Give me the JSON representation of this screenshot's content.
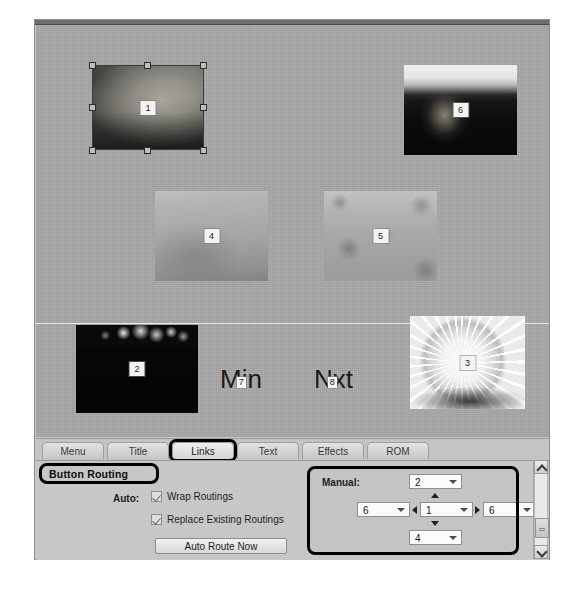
{
  "window": {
    "title": "Button Routing editor"
  },
  "canvas": {
    "guide_line_label": "horizontal-guide",
    "thumbnails": [
      {
        "badge": "1",
        "name": "thumbnail-1",
        "selected": true
      },
      {
        "badge": "6",
        "name": "thumbnail-6",
        "selected": false
      },
      {
        "badge": "4",
        "name": "thumbnail-4",
        "selected": false
      },
      {
        "badge": "5",
        "name": "thumbnail-5",
        "selected": false
      },
      {
        "badge": "2",
        "name": "thumbnail-2",
        "selected": false
      },
      {
        "badge": "3",
        "name": "thumbnail-3",
        "selected": false
      }
    ],
    "text_buttons": [
      {
        "name": "main-text-button",
        "before": "M",
        "badge": "7",
        "after": "in"
      },
      {
        "name": "next-text-button",
        "before": "N",
        "badge": "8",
        "after": "xt"
      }
    ]
  },
  "tabs": {
    "items": [
      {
        "label": "Menu",
        "active": false
      },
      {
        "label": "Title",
        "active": false
      },
      {
        "label": "Links",
        "active": true
      },
      {
        "label": "Text",
        "active": false
      },
      {
        "label": "Effects",
        "active": false
      },
      {
        "label": "ROM",
        "active": false
      }
    ],
    "highlighted": "Links"
  },
  "options": {
    "section_title": "Button Routing",
    "auto_label": "Auto:",
    "checkboxes": [
      {
        "label": "Wrap Routings",
        "checked": true
      },
      {
        "label": "Replace Existing Routings",
        "checked": true
      }
    ],
    "auto_route_button": "Auto Route Now",
    "manual": {
      "label": "Manual:",
      "up": "2",
      "left": "6",
      "center": "1",
      "right": "6",
      "down": "4"
    }
  },
  "scrollbar": {
    "up_icon": "chevron-up-icon",
    "down_icon": "chevron-down-icon"
  },
  "colors": {
    "annotation": "#000000",
    "canvas_bg": "#a8a8a8",
    "panel_bg": "#c7c7c7"
  }
}
